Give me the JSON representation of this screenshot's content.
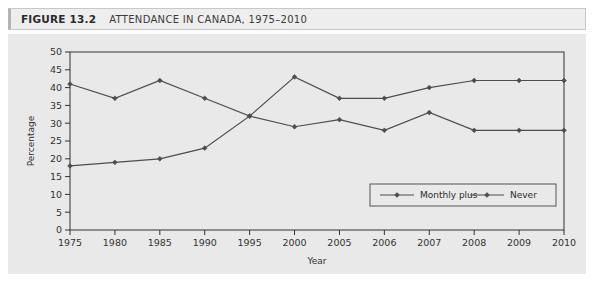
{
  "figure": {
    "label": "FIGURE 13.2",
    "title": "ATTENDANCE IN CANADA, 1975–2010"
  },
  "chart_data": {
    "type": "line",
    "xlabel": "Year",
    "ylabel": "Percentage",
    "categories": [
      "1975",
      "1980",
      "1985",
      "1990",
      "1995",
      "2000",
      "2005",
      "2006",
      "2007",
      "2008",
      "2009",
      "2010"
    ],
    "yticks": [
      0,
      5,
      10,
      15,
      20,
      25,
      30,
      35,
      40,
      45,
      50
    ],
    "ylim": [
      0,
      50
    ],
    "grid": false,
    "legend_position": "inside-bottom-right",
    "series": [
      {
        "name": "Monthly plus",
        "color": "#4d4d4d",
        "marker": "diamond",
        "values": [
          18,
          19,
          20,
          23,
          32,
          29,
          31,
          28,
          33,
          28,
          28,
          28
        ]
      },
      {
        "name": "Never",
        "color": "#4d4d4d",
        "marker": "diamond",
        "values": [
          41,
          37,
          42,
          37,
          32,
          43,
          37,
          37,
          40,
          42,
          42,
          42
        ]
      }
    ]
  },
  "colors": {
    "panel_background": "#e9e9e9",
    "title_background": "#eeeeee",
    "line": "#4d4d4d",
    "axis": "#333333"
  }
}
